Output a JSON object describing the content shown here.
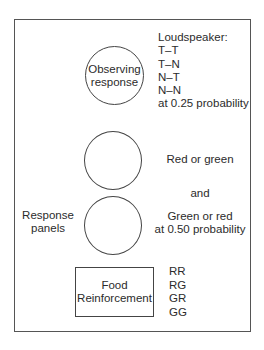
{
  "diagram": {
    "observing_circle": {
      "lines": [
        "Observing",
        "response"
      ]
    },
    "loudspeaker": {
      "heading": "Loudspeaker:",
      "options": [
        "T–T",
        "T–N",
        "N–T",
        "N–N"
      ],
      "probability": "at 0.25 probability"
    },
    "response_panels": {
      "label_lines": [
        "Response",
        "panels"
      ],
      "panel1_text": "Red or green",
      "connector": "and",
      "panel2_text": "Green or red",
      "probability": "at 0.50 probability"
    },
    "food_reinforcement": {
      "lines": [
        "Food",
        "Reinforcement"
      ],
      "combinations": [
        "RR",
        "RG",
        "GR",
        "GG"
      ]
    }
  }
}
